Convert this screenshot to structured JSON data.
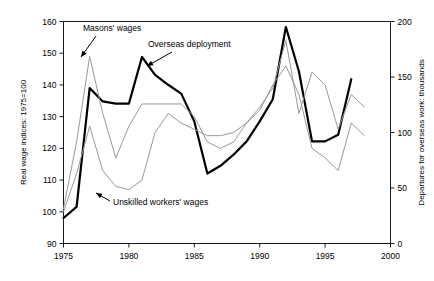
{
  "chart_data": {
    "type": "line",
    "title": "",
    "xlabel": "",
    "ylabel": "Real wage indices: 1975=100",
    "y2label": "Departures for overseas work: thousands",
    "xlim": [
      1975,
      2000
    ],
    "ylim": [
      90,
      160
    ],
    "y2lim": [
      0,
      200
    ],
    "grid": false,
    "legend_position": "none",
    "x_ticks": [
      "1975",
      "1980",
      "1985",
      "1990",
      "1995",
      "2000"
    ],
    "x_tick_values": [
      1975,
      1980,
      1985,
      1990,
      1995,
      2000
    ],
    "y_ticks": [
      "90",
      "100",
      "110",
      "120",
      "130",
      "140",
      "150",
      "160"
    ],
    "y_tick_values": [
      90,
      100,
      110,
      120,
      130,
      140,
      150,
      160
    ],
    "y2_ticks": [
      "0",
      "50",
      "100",
      "150",
      "200"
    ],
    "y2_tick_values": [
      0,
      50,
      100,
      150,
      200
    ],
    "x": [
      1975,
      1976,
      1977,
      1978,
      1979,
      1980,
      1981,
      1982,
      1983,
      1984,
      1985,
      1986,
      1987,
      1988,
      1989,
      1990,
      1991,
      1992,
      1993,
      1994,
      1995,
      1996,
      1997
    ],
    "series": [
      {
        "name": "Overseas deployment",
        "axis": "right",
        "style": "thick-black",
        "color": "#000000",
        "width": 2.2,
        "x": [
          1975,
          1976,
          1977,
          1978,
          1979,
          1980,
          1981,
          1982,
          1983,
          1984,
          1985,
          1986,
          1987,
          1988,
          1989,
          1990,
          1991,
          1992,
          1993,
          1994,
          1995,
          1996,
          1997
        ],
        "values": [
          23,
          33,
          140,
          128,
          126,
          126,
          168,
          152,
          143,
          135,
          110,
          63,
          70,
          80,
          92,
          110,
          130,
          195,
          155,
          92,
          92,
          98,
          148
        ]
      },
      {
        "name": "Masons' wages",
        "axis": "left",
        "style": "thin-gray",
        "color": "#999999",
        "width": 1,
        "x": [
          1975,
          1976,
          1977,
          1978,
          1979,
          1980,
          1981,
          1982,
          1983,
          1984,
          1985,
          1986,
          1987,
          1988,
          1989,
          1990,
          1991,
          1992,
          1993,
          1994,
          1995,
          1996,
          1997,
          1998
        ],
        "values": [
          101,
          122,
          149,
          131,
          117,
          127,
          134,
          134,
          134,
          134,
          130,
          122,
          120,
          122,
          128,
          133,
          139,
          154,
          131,
          144,
          140,
          126,
          137,
          133
        ]
      },
      {
        "name": "Unskilled workers' wages",
        "axis": "left",
        "style": "thin-gray",
        "color": "#999999",
        "width": 1,
        "x": [
          1975,
          1976,
          1977,
          1978,
          1979,
          1980,
          1981,
          1982,
          1983,
          1984,
          1985,
          1986,
          1987,
          1988,
          1989,
          1990,
          1991,
          1992,
          1993,
          1994,
          1995,
          1996,
          1997,
          1998
        ],
        "values": [
          100,
          112,
          127,
          113,
          108,
          107,
          110,
          125,
          131,
          128,
          126,
          124,
          124,
          125,
          128,
          132,
          140,
          146,
          137,
          120,
          117,
          113,
          128,
          124
        ]
      }
    ],
    "annotations": [
      {
        "text": "Masons' wages",
        "x": 1977,
        "y": 149
      },
      {
        "text": "Overseas deployment",
        "x": 1981,
        "y": 168
      },
      {
        "text": "Unskilled workers' wages",
        "x": 1978,
        "y": 107
      }
    ]
  },
  "annotation_labels": {
    "masons": "Masons' wages",
    "overseas": "Overseas deployment",
    "unskilled": "Unskilled workers' wages"
  },
  "axis_titles": {
    "left": "Real wage indices: 1975=100",
    "right": "Departures for overseas work: thousands"
  }
}
